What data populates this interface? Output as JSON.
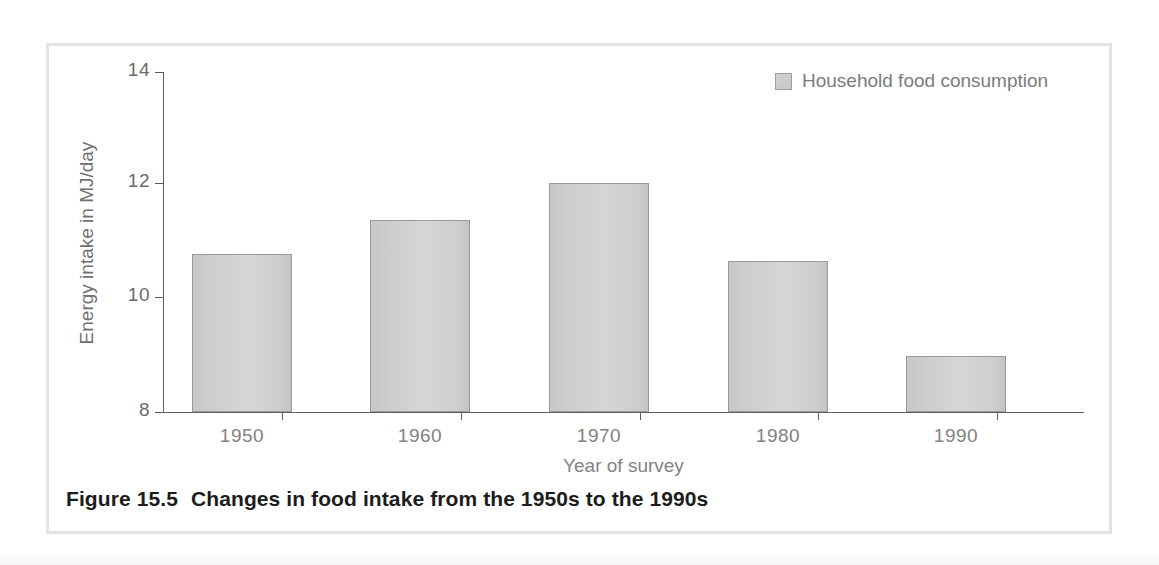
{
  "figure": {
    "caption_number": "Figure 15.5",
    "caption_text": "Changes in food intake from the 1950s to the 1990s"
  },
  "legend": {
    "position": "top-right",
    "entries": [
      {
        "label": "Household food consumption",
        "swatch_color": "#cccccc"
      }
    ]
  },
  "chart_data": {
    "type": "bar",
    "title": "",
    "subtitle": "",
    "categories": [
      "1950",
      "1960",
      "1970",
      "1980",
      "1990"
    ],
    "series": [
      {
        "name": "Household food consumption",
        "values": [
          10.78,
          11.38,
          12.05,
          10.67,
          8.98
        ]
      }
    ],
    "xlabel": "Year of survey",
    "ylabel": "Energy intake in MJ/day",
    "ylim": [
      8,
      14
    ],
    "yticks": [
      8,
      10,
      12,
      14
    ],
    "ytick_labels": [
      "8",
      "10",
      "12",
      "14"
    ],
    "xtick_labels": [
      "1950",
      "1960",
      "1970",
      "1980",
      "1990"
    ],
    "grid": false,
    "legend_position": "top-right",
    "bar_color": "#d2d2d2",
    "bar_edge_color": "#9a9a9a",
    "axis_color": "#5f5f5f"
  }
}
